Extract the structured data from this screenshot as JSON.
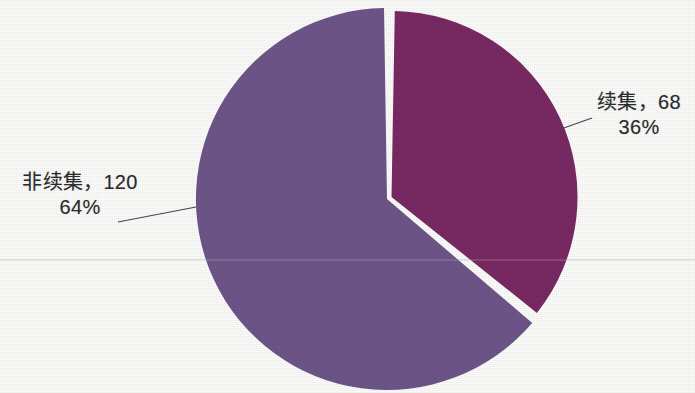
{
  "chart_data": {
    "type": "pie",
    "title": "",
    "subtitle": "",
    "xlabel": "",
    "ylabel": "",
    "legend_position": "none",
    "grid": false,
    "total": 188,
    "start_angle_deg": 0,
    "direction": "clockwise",
    "categories": [
      "续集",
      "非续集"
    ],
    "values": [
      68,
      120
    ],
    "percentages": [
      36,
      64
    ],
    "slices": [
      {
        "name": "续集",
        "value": 68,
        "percent": 36,
        "percent_label": "36%",
        "label_line1": "续集，68",
        "label_line2": "36%",
        "color": "#7a2a63",
        "start_deg": 0,
        "end_deg": 129.6,
        "label_side": "right"
      },
      {
        "name": "非续集",
        "value": 120,
        "percent": 64,
        "percent_label": "64%",
        "label_line1": "非续集，120",
        "label_line2": "64%",
        "color": "#6e5689",
        "start_deg": 129.6,
        "end_deg": 360,
        "label_side": "left"
      }
    ]
  },
  "figure": {
    "background_color": "#fdfdfc",
    "slice_gap_color": "#ffffff",
    "leader_line_color": "#4c4450",
    "text_color": "#2b2b2b",
    "center_x": 387,
    "center_y": 199,
    "radius": 191
  },
  "labels": {
    "sequel": {
      "line1": "续集，68",
      "line2": "36%"
    },
    "nonsequel": {
      "line1": "非续集，120",
      "line2": "64%"
    }
  }
}
